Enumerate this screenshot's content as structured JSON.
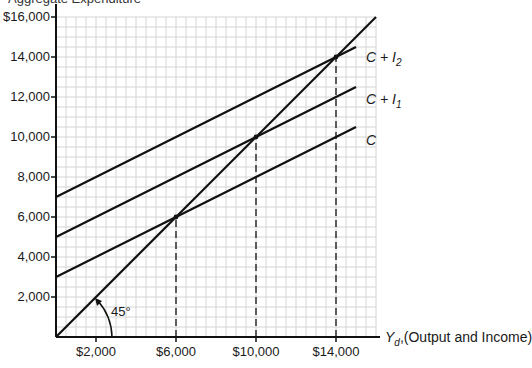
{
  "chart_data": {
    "type": "line",
    "title": "",
    "top_caption_cropped": "Aggregate Expenditure",
    "xlabel": "Yd, (Output and Income)",
    "ylabel": "",
    "xlim": [
      0,
      16000
    ],
    "ylim": [
      0,
      16000
    ],
    "grid": true,
    "grid_step": 500,
    "x_ticks": [
      "$2,000",
      "$6,000",
      "$10,000",
      "$14,000"
    ],
    "x_tick_values": [
      2000,
      6000,
      10000,
      14000
    ],
    "y_ticks": [
      "$16,000",
      "14,000",
      "12,000",
      "10,000",
      "8,000",
      "6,000",
      "4,000",
      "2,000"
    ],
    "y_tick_values": [
      16000,
      14000,
      12000,
      10000,
      8000,
      6000,
      4000,
      2000
    ],
    "series": [
      {
        "name": "45° line",
        "x": [
          0,
          16000
        ],
        "y": [
          0,
          16000
        ]
      },
      {
        "name": "C",
        "x": [
          0,
          15000
        ],
        "y": [
          3000,
          10500
        ]
      },
      {
        "name": "C + I1",
        "x": [
          0,
          15000
        ],
        "y": [
          5000,
          12500
        ]
      },
      {
        "name": "C + I2",
        "x": [
          0,
          15000
        ],
        "y": [
          7000,
          14500
        ]
      }
    ],
    "equilibria": [
      {
        "x": 6000,
        "y": 6000,
        "series": "C"
      },
      {
        "x": 10000,
        "y": 10000,
        "series": "C + I1"
      },
      {
        "x": 14000,
        "y": 14000,
        "series": "C + I2"
      }
    ],
    "annotations": [
      "45°"
    ]
  },
  "labels": {
    "C": "C",
    "CI1_main": "C + I",
    "CI1_sub": "1",
    "CI2_main": "C + I",
    "CI2_sub": "2",
    "angle": "45°",
    "x_axis_var": "Y",
    "x_axis_sub": "d",
    "x_axis_text": ",(Output and Income)",
    "top": "Aggregate Expenditure"
  }
}
